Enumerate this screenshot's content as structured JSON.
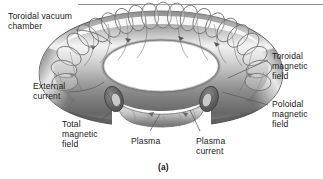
{
  "figure": {
    "caption": "(a)",
    "style": "grayscale-shaded-line-art",
    "colors": {
      "background": "#ffffff",
      "text": "#1c1c1c",
      "leader_line": "#5a5a5a",
      "torus_outline": "#4a4a4a",
      "torus_dark": "#6d6d6d",
      "torus_mid": "#a8a8a8",
      "torus_light": "#efefef",
      "torus_shadow": "#585858",
      "coil_stroke": "#777777",
      "plasma_tube": "#b5b5b5",
      "cut_ring_dark": "#5f5f5f",
      "rule": "#909090"
    }
  },
  "labels": [
    {
      "id": "toroidal-vacuum-chamber",
      "lines": [
        "Toroidal vacuum",
        "chamber"
      ],
      "x": 8,
      "y": 11,
      "align": "left"
    },
    {
      "id": "external-current",
      "lines": [
        "External",
        "current"
      ],
      "x": 33,
      "y": 81,
      "align": "left"
    },
    {
      "id": "total-magnetic-field",
      "lines": [
        "Total",
        "magnetic",
        "field"
      ],
      "x": 62,
      "y": 119,
      "align": "left"
    },
    {
      "id": "plasma",
      "lines": [
        "Plasma"
      ],
      "x": 131,
      "y": 136,
      "align": "left"
    },
    {
      "id": "plasma-current",
      "lines": [
        "Plasma",
        "current"
      ],
      "x": 196,
      "y": 136,
      "align": "left"
    },
    {
      "id": "toroidal-magnetic-field",
      "lines": [
        "Toroidal",
        "magnetic",
        "field"
      ],
      "x": 272,
      "y": 51,
      "align": "left"
    },
    {
      "id": "poloidal-magnetic-field",
      "lines": [
        "Poloidal",
        "magnetic",
        "field"
      ],
      "x": 272,
      "y": 99,
      "align": "left"
    }
  ],
  "caption_position": {
    "x": 158,
    "y": 162
  }
}
